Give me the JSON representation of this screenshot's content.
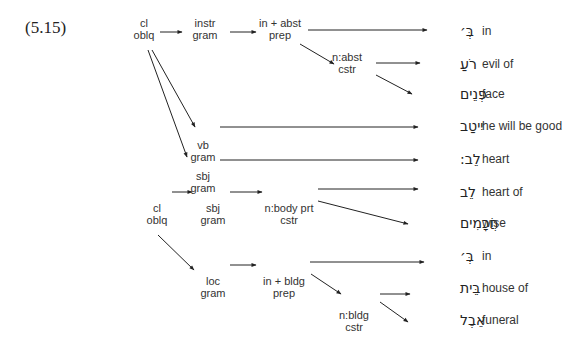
{
  "example_label": "(5.15)",
  "nodes": [
    {
      "id": "cl1",
      "lines": [
        "cl",
        "oblq"
      ],
      "x": 144,
      "y": 27
    },
    {
      "id": "instr",
      "lines": [
        "instr",
        "gram"
      ],
      "x": 205,
      "y": 27
    },
    {
      "id": "inabst",
      "lines": [
        "in + abst",
        "prep"
      ],
      "x": 280,
      "y": 27
    },
    {
      "id": "nabst",
      "lines": [
        "n:abst",
        "cstr"
      ],
      "x": 347,
      "y": 61
    },
    {
      "id": "vb",
      "lines": [
        "vb",
        "gram"
      ],
      "x": 203,
      "y": 149
    },
    {
      "id": "sbj1",
      "lines": [
        "sbj",
        "gram"
      ],
      "x": 203,
      "y": 180
    },
    {
      "id": "cl2",
      "lines": [
        "cl",
        "oblq"
      ],
      "x": 157,
      "y": 212
    },
    {
      "id": "sbj2",
      "lines": [
        "sbj",
        "gram"
      ],
      "x": 213,
      "y": 212
    },
    {
      "id": "nbody",
      "lines": [
        "n:body prt",
        "cstr"
      ],
      "x": 289,
      "y": 212
    },
    {
      "id": "loc",
      "lines": [
        "loc",
        "gram"
      ],
      "x": 213,
      "y": 285
    },
    {
      "id": "inbldg",
      "lines": [
        "in + bldg",
        "prep"
      ],
      "x": 284,
      "y": 285
    },
    {
      "id": "nbldg",
      "lines": [
        "n:bldg",
        "cstr"
      ],
      "x": 354,
      "y": 319
    }
  ],
  "leaves": [
    {
      "hebrew": "בְּ׳",
      "gloss": "in",
      "y": 35
    },
    {
      "hebrew": "רֹעַ",
      "gloss": "evil of",
      "y": 68
    },
    {
      "hebrew": "פְּנֵים",
      "gloss": "face",
      "y": 98
    },
    {
      "hebrew": "יִיטַב",
      "gloss": "he will be good",
      "y": 130
    },
    {
      "hebrew": "לֵב:",
      "gloss": "heart",
      "y": 163
    },
    {
      "hebrew": "לֵב",
      "gloss": "heart of",
      "y": 196
    },
    {
      "hebrew": "חֲכָמִים",
      "gloss": "wise",
      "y": 227
    },
    {
      "hebrew": "בְּ׳",
      "gloss": "in",
      "y": 260
    },
    {
      "hebrew": "בֵּית",
      "gloss": "house of",
      "y": 292
    },
    {
      "hebrew": "אֵבֶל",
      "gloss": "funeral",
      "y": 324
    }
  ],
  "edges": [
    [
      160,
      32,
      182,
      32
    ],
    [
      230,
      32,
      256,
      32
    ],
    [
      308,
      30,
      427,
      30
    ],
    [
      300,
      44,
      334,
      64
    ],
    [
      376,
      63,
      420,
      63
    ],
    [
      376,
      75,
      412,
      94
    ],
    [
      152,
      50,
      195,
      127
    ],
    [
      148,
      50,
      187,
      157
    ],
    [
      220,
      127,
      418,
      127
    ],
    [
      220,
      160,
      418,
      160
    ],
    [
      172,
      192,
      192,
      192
    ],
    [
      230,
      192,
      262,
      192
    ],
    [
      318,
      189,
      418,
      189
    ],
    [
      318,
      201,
      408,
      224
    ],
    [
      158,
      235,
      194,
      270
    ],
    [
      230,
      265,
      256,
      265
    ],
    [
      310,
      262,
      424,
      262
    ],
    [
      311,
      274,
      341,
      294
    ],
    [
      380,
      294,
      410,
      294
    ],
    [
      380,
      302,
      408,
      322
    ]
  ],
  "hebrew_right_x": 460,
  "gloss_x": 482
}
